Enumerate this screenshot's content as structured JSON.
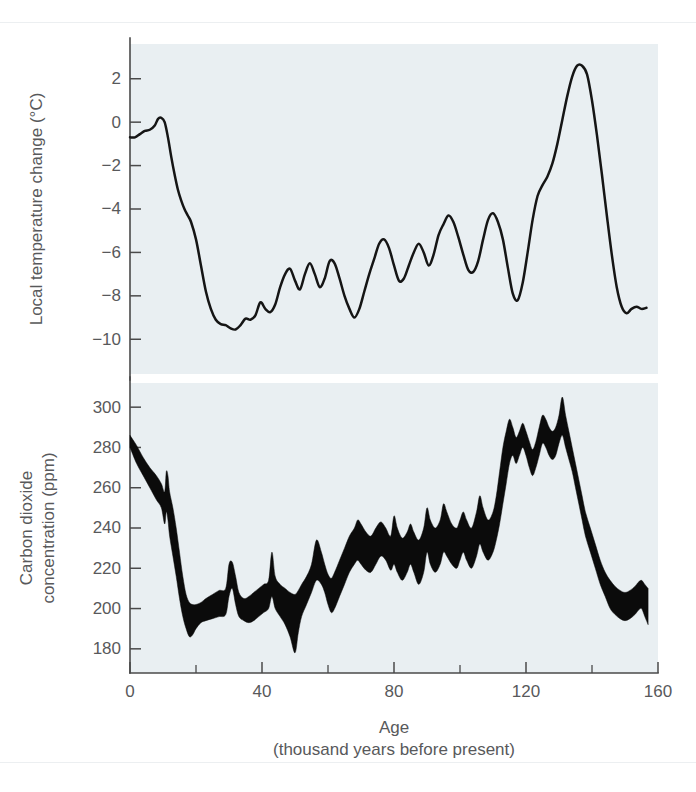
{
  "figure": {
    "background_color": "#ffffff",
    "plot_background_color": "#e9eff2",
    "curve_color": "#151515",
    "band_color": "#0b0b0b",
    "axis_color": "#4a4a4a",
    "label_color": "#58595b"
  },
  "axes": {
    "x": {
      "label_line1": "Age",
      "label_line2": "(thousand years before present)",
      "ticks": [
        "0",
        "40",
        "80",
        "120",
        "160"
      ],
      "tick_values": [
        0,
        40,
        80,
        120,
        160
      ],
      "minor_tick_values": [
        20,
        60,
        100,
        140
      ],
      "min": 0,
      "max": 160
    },
    "temperature_y": {
      "label": "Local temperature change (°C)",
      "ticks": [
        "2",
        "0",
        "−2",
        "−4",
        "−6",
        "−8",
        "−10"
      ],
      "tick_values": [
        2,
        0,
        -2,
        -4,
        -6,
        -8,
        -10
      ],
      "min": -11.6,
      "max": 3.6
    },
    "co2_y": {
      "label_line1": "Carbon dioxide",
      "label_line2": "concentration (ppm)",
      "ticks": [
        "300",
        "280",
        "260",
        "240",
        "220",
        "200",
        "180"
      ],
      "tick_values": [
        300,
        280,
        260,
        240,
        220,
        200,
        180
      ],
      "min": 168,
      "max": 312
    }
  },
  "chart_data": [
    {
      "type": "line",
      "title": "Local temperature change",
      "xlabel": "Age (thousand years before present)",
      "ylabel": "Local temperature change (°C)",
      "xlim": [
        0,
        160
      ],
      "ylim": [
        -11.6,
        3.6
      ],
      "grid": false,
      "legend": "none",
      "series": [
        {
          "name": "Local temperature change",
          "x": [
            0,
            1.5,
            3,
            4.5,
            6,
            7.5,
            8.5,
            9.5,
            10.5,
            11.5,
            12.5,
            13.5,
            14.5,
            15.5,
            16.5,
            17.5,
            18.5,
            20,
            21.5,
            23,
            24.5,
            26,
            27.5,
            29,
            30.5,
            32,
            33.5,
            35,
            36.5,
            38,
            39.5,
            41,
            42.5,
            44,
            45.5,
            47,
            48.5,
            50,
            51.5,
            53,
            54.5,
            56,
            57.5,
            59,
            60.5,
            62,
            63.5,
            65,
            66.5,
            68,
            69.5,
            71,
            72.5,
            74,
            75.5,
            77,
            78.5,
            80,
            81.5,
            83,
            84.5,
            86,
            87.5,
            89,
            90.5,
            92,
            93.5,
            95,
            96.5,
            98,
            99.5,
            101,
            102.5,
            104,
            105.5,
            107,
            108.5,
            110,
            111.5,
            113,
            114.5,
            116,
            117.5,
            119,
            120.5,
            122,
            123.5,
            125,
            126.5,
            128,
            129.5,
            131,
            132.5,
            134,
            135.5,
            137,
            138.5,
            140,
            141.5,
            143,
            144.5,
            146,
            147.5,
            149,
            150.5,
            152,
            153.5,
            155,
            156.5
          ],
          "y": [
            -0.7,
            -0.7,
            -0.55,
            -0.4,
            -0.35,
            -0.15,
            0.15,
            0.2,
            0.0,
            -0.7,
            -1.6,
            -2.4,
            -3.1,
            -3.6,
            -4.0,
            -4.3,
            -4.6,
            -5.4,
            -6.6,
            -7.8,
            -8.6,
            -9.1,
            -9.3,
            -9.35,
            -9.5,
            -9.55,
            -9.35,
            -9.05,
            -9.1,
            -8.9,
            -8.3,
            -8.6,
            -8.75,
            -8.4,
            -7.6,
            -7.0,
            -6.75,
            -7.3,
            -7.7,
            -7.0,
            -6.5,
            -7.0,
            -7.6,
            -7.2,
            -6.4,
            -6.5,
            -7.2,
            -8.0,
            -8.6,
            -9.0,
            -8.6,
            -7.8,
            -7.0,
            -6.3,
            -5.6,
            -5.4,
            -5.8,
            -6.6,
            -7.3,
            -7.2,
            -6.6,
            -6.0,
            -5.6,
            -6.0,
            -6.6,
            -6.1,
            -5.2,
            -4.7,
            -4.3,
            -4.6,
            -5.3,
            -6.1,
            -6.8,
            -6.9,
            -6.4,
            -5.4,
            -4.5,
            -4.2,
            -4.6,
            -5.4,
            -6.7,
            -7.9,
            -8.2,
            -7.4,
            -6.0,
            -4.5,
            -3.4,
            -2.9,
            -2.5,
            -1.9,
            -1.0,
            0.1,
            1.2,
            2.1,
            2.6,
            2.6,
            2.2,
            1.0,
            -0.6,
            -2.4,
            -4.3,
            -6.1,
            -7.6,
            -8.5,
            -8.8,
            -8.6,
            -8.5,
            -8.6,
            -8.55,
            -8.3,
            -8.2
          ]
        }
      ]
    },
    {
      "type": "area",
      "title": "Carbon dioxide concentration",
      "xlabel": "Age (thousand years before present)",
      "ylabel": "Carbon dioxide concentration (ppm)",
      "xlim": [
        0,
        160
      ],
      "ylim": [
        168,
        312
      ],
      "grid": false,
      "legend": "none",
      "band_description": "Filled envelope between upper and lower bounds of measured CO2 concentration",
      "series": [
        {
          "name": "CO2 upper bound",
          "x": [
            0,
            2,
            4,
            6,
            8,
            9.5,
            10.5,
            11,
            11.5,
            12,
            13,
            14,
            15,
            16,
            17,
            18,
            19,
            20,
            21.5,
            23,
            25,
            27,
            29,
            30,
            31,
            32,
            33,
            34.5,
            36,
            37.5,
            39,
            40.5,
            42,
            43,
            44,
            45.5,
            47,
            48.5,
            50,
            51,
            52,
            53.5,
            55,
            56.5,
            58,
            59,
            60,
            61,
            62,
            63.5,
            65,
            66.5,
            68,
            69,
            70,
            71.5,
            73,
            74.5,
            76,
            77.5,
            79,
            80,
            81,
            82.5,
            84,
            85,
            86,
            87.5,
            89,
            90,
            91,
            92.5,
            94,
            95,
            96,
            97.5,
            99,
            100,
            101,
            102,
            103.5,
            105,
            106,
            107,
            108.5,
            110,
            111,
            112,
            113,
            114,
            115,
            116,
            117,
            118,
            119,
            120,
            121,
            122,
            123,
            124,
            125,
            126,
            127,
            128,
            129,
            130,
            131,
            132,
            133,
            134,
            135,
            136,
            137,
            138,
            139.5,
            141,
            142.5,
            144,
            145.5,
            147,
            148.5,
            150,
            151.5,
            153,
            154,
            155,
            156,
            157
          ],
          "y": [
            286,
            281,
            275,
            270,
            266,
            262,
            258,
            268,
            266,
            258,
            250,
            240,
            228,
            216,
            207,
            203,
            202,
            202,
            203,
            205,
            207,
            209,
            210,
            222,
            223,
            216,
            208,
            205,
            206,
            208,
            210,
            212,
            214,
            228,
            216,
            212,
            210,
            208,
            207,
            209,
            212,
            216,
            222,
            234,
            228,
            222,
            217,
            215,
            218,
            224,
            230,
            236,
            240,
            244,
            242,
            238,
            236,
            240,
            243,
            240,
            236,
            246,
            240,
            235,
            238,
            242,
            238,
            234,
            240,
            250,
            244,
            240,
            244,
            252,
            248,
            242,
            240,
            244,
            248,
            244,
            240,
            248,
            256,
            250,
            244,
            248,
            256,
            268,
            280,
            288,
            294,
            290,
            285,
            288,
            292,
            288,
            283,
            279,
            283,
            290,
            296,
            294,
            290,
            288,
            290,
            296,
            305,
            296,
            288,
            280,
            272,
            264,
            256,
            248,
            240,
            232,
            224,
            218,
            214,
            211,
            209,
            208,
            209,
            211,
            213,
            214,
            212,
            210,
            208
          ]
        },
        {
          "name": "CO2 lower bound",
          "x": [
            0,
            2,
            4,
            6,
            8,
            9.5,
            10.5,
            11,
            11.5,
            12,
            13,
            14,
            15,
            16,
            17,
            18,
            19,
            20,
            21.5,
            23,
            25,
            27,
            29,
            30,
            31,
            32,
            33,
            34.5,
            36,
            37.5,
            39,
            40.5,
            42,
            43,
            44,
            45.5,
            47,
            48.5,
            50,
            51,
            52,
            53.5,
            55,
            56.5,
            58,
            59,
            60,
            61,
            62,
            63.5,
            65,
            66.5,
            68,
            69,
            70,
            71.5,
            73,
            74.5,
            76,
            77.5,
            79,
            80,
            81,
            82.5,
            84,
            85,
            86,
            87.5,
            89,
            90,
            91,
            92.5,
            94,
            95,
            96,
            97.5,
            99,
            100,
            101,
            102,
            103.5,
            105,
            106,
            107,
            108.5,
            110,
            111,
            112,
            113,
            114,
            115,
            116,
            117,
            118,
            119,
            120,
            121,
            122,
            123,
            124,
            125,
            126,
            127,
            128,
            129,
            130,
            131,
            132,
            133,
            134,
            135,
            136,
            137,
            138,
            139.5,
            141,
            142.5,
            144,
            145.5,
            147,
            148.5,
            150,
            151.5,
            153,
            154,
            155,
            156,
            157
          ],
          "y": [
            280,
            272,
            266,
            260,
            254,
            250,
            242,
            248,
            244,
            236,
            226,
            216,
            205,
            196,
            190,
            186,
            187,
            190,
            193,
            194,
            195,
            196,
            197,
            206,
            210,
            202,
            196,
            194,
            193,
            194,
            196,
            198,
            200,
            206,
            200,
            196,
            192,
            186,
            178,
            188,
            196,
            202,
            208,
            214,
            212,
            208,
            202,
            198,
            200,
            206,
            212,
            218,
            222,
            224,
            222,
            219,
            218,
            222,
            226,
            224,
            219,
            222,
            218,
            214,
            218,
            222,
            218,
            212,
            218,
            228,
            222,
            218,
            222,
            228,
            226,
            222,
            220,
            224,
            228,
            224,
            220,
            226,
            232,
            228,
            224,
            228,
            234,
            242,
            252,
            262,
            272,
            276,
            272,
            276,
            280,
            276,
            270,
            266,
            270,
            276,
            282,
            280,
            276,
            274,
            276,
            282,
            286,
            280,
            274,
            268,
            260,
            252,
            244,
            236,
            228,
            220,
            212,
            206,
            200,
            197,
            195,
            194,
            195,
            197,
            199,
            200,
            196,
            192,
            190
          ]
        }
      ]
    }
  ]
}
